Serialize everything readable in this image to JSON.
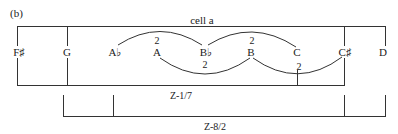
{
  "figure": {
    "panel_label": "(b)",
    "cell_label": "cell a",
    "notes": [
      "F♯",
      "G",
      "A♭",
      "A",
      "B♭",
      "B",
      "C",
      "C♯",
      "D"
    ],
    "interval_labels": {
      "above_A": "2",
      "above_B": "2",
      "below_Bb": "2",
      "below_C": "2"
    },
    "brackets": {
      "z1": "Z-1/7",
      "z2": "Z-8/2"
    },
    "line_color": "#333333"
  }
}
